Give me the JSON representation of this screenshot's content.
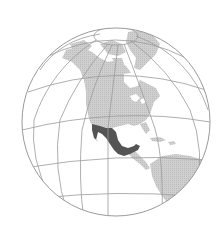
{
  "map": {
    "title": "Location of Mexico",
    "projection": "orthographic",
    "highlighted_region": "Mexico",
    "visible_regions": [
      "North America",
      "Greenland",
      "Central America",
      "South America",
      "Caribbean"
    ],
    "colors": {
      "background": "#ffffff",
      "ocean": "#ffffff",
      "land": "#c9c9c9",
      "highlight": "#545454",
      "graticule": "#9a9a9a",
      "outline": "#9a9a9a"
    },
    "globe": {
      "cx": 116,
      "cy": 122,
      "r": 94
    }
  }
}
